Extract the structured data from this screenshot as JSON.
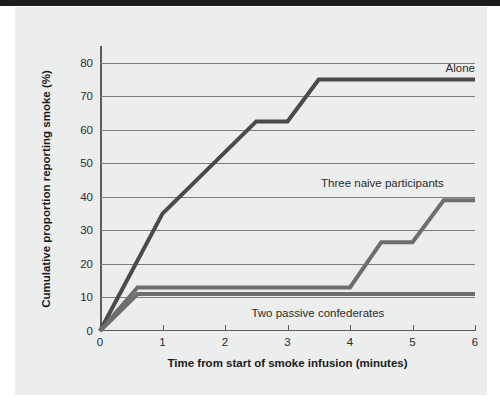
{
  "figure": {
    "background_color": "#eceded",
    "page_color": "#ffffff",
    "top_bar_color": "#1d1d1d"
  },
  "chart_data": {
    "type": "line",
    "title": "",
    "xlabel": "Time from start of smoke infusion (minutes)",
    "ylabel": "Cumulative proportion reporting smoke (%)",
    "xlim": [
      0,
      6
    ],
    "ylim": [
      0,
      85
    ],
    "xticks": [
      0,
      1,
      2,
      3,
      4,
      5,
      6
    ],
    "xtick_labels": [
      "0",
      "1",
      "2",
      "3",
      "4",
      "5",
      "6"
    ],
    "yticks": [
      0,
      10,
      20,
      30,
      40,
      50,
      60,
      70,
      80
    ],
    "ytick_labels": [
      "0",
      "10",
      "20",
      "30",
      "40",
      "50",
      "60",
      "70",
      "80"
    ],
    "grid": "horizontal",
    "legend_position": "inline-annotations",
    "series": [
      {
        "name": "Alone",
        "color": "#4a4a4a",
        "line_width": 4,
        "label_x": 6.0,
        "label_y": 78.5,
        "x": [
          0,
          1,
          2.5,
          3.0,
          3.5,
          6
        ],
        "y": [
          0,
          35,
          62.5,
          62.5,
          75,
          75
        ]
      },
      {
        "name": "Three naive participants",
        "color": "#6e6e6e",
        "line_width": 4,
        "label_x": 5.5,
        "label_y": 44,
        "x": [
          0,
          0.6,
          4.0,
          4.5,
          5.0,
          5.5,
          6
        ],
        "y": [
          0,
          13,
          13,
          26.5,
          26.5,
          39,
          39
        ]
      },
      {
        "name": "Two passive confederates",
        "color": "#6e6e6e",
        "line_width": 4,
        "label_x": 4.55,
        "label_y": 5.5,
        "x": [
          0,
          0.6,
          6
        ],
        "y": [
          0,
          11,
          11
        ]
      }
    ]
  }
}
